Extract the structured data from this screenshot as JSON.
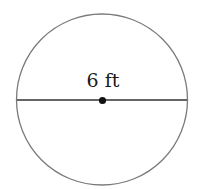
{
  "diagram": {
    "shape": "circle",
    "diameter_label": "6 ft",
    "colors": {
      "outline": "#7a7a7a",
      "diameter": "#333333",
      "center_dot": "#111111",
      "text": "#1a1a1a"
    }
  }
}
